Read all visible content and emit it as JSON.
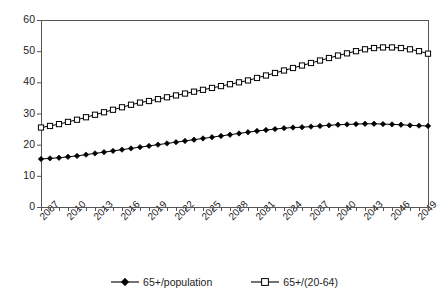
{
  "chart_data": {
    "type": "line",
    "title": "",
    "subtitle": "",
    "xlabel": "",
    "ylabel": "",
    "ylim": [
      0,
      60
    ],
    "ytick_values": [
      0,
      10,
      20,
      30,
      40,
      50,
      60
    ],
    "ytick_labels": [
      "0",
      "10",
      "20",
      "30",
      "40",
      "50",
      "60"
    ],
    "grid": false,
    "legend_position": "bottom",
    "x": [
      2007,
      2008,
      2009,
      2010,
      2011,
      2012,
      2013,
      2014,
      2015,
      2016,
      2017,
      2018,
      2019,
      2020,
      2021,
      2022,
      2023,
      2024,
      2025,
      2026,
      2027,
      2028,
      2029,
      2030,
      2031,
      2032,
      2033,
      2034,
      2035,
      2036,
      2037,
      2038,
      2039,
      2040,
      2041,
      2042,
      2043,
      2044,
      2045,
      2046,
      2047,
      2048,
      2049,
      2050
    ],
    "xlim": [
      2007,
      2050
    ],
    "xtick_labels": [
      "2007",
      "2010",
      "2013",
      "2016",
      "2019",
      "2022",
      "2025",
      "2028",
      "2031",
      "2034",
      "2037",
      "2040",
      "2043",
      "2046",
      "2049"
    ],
    "xtick_values": [
      2007,
      2010,
      2013,
      2016,
      2019,
      2022,
      2025,
      2028,
      2031,
      2034,
      2037,
      2040,
      2043,
      2046,
      2049
    ],
    "series": [
      {
        "name": "65+/population",
        "marker": "filled-diamond",
        "color": "#000000",
        "values": [
          15.4,
          15.6,
          15.8,
          16.1,
          16.4,
          16.8,
          17.2,
          17.6,
          18.0,
          18.4,
          18.8,
          19.2,
          19.6,
          20.0,
          20.4,
          20.8,
          21.2,
          21.6,
          22.0,
          22.4,
          22.8,
          23.2,
          23.6,
          24.0,
          24.4,
          24.7,
          25.0,
          25.3,
          25.5,
          25.6,
          25.8,
          26.0,
          26.2,
          26.4,
          26.5,
          26.6,
          26.7,
          26.7,
          26.6,
          26.5,
          26.4,
          26.2,
          26.1,
          26.0
        ]
      },
      {
        "name": "65+/(20-64)",
        "marker": "open-square",
        "color": "#000000",
        "values": [
          25.5,
          26.0,
          26.6,
          27.3,
          28.0,
          28.8,
          29.6,
          30.4,
          31.2,
          32.0,
          32.8,
          33.5,
          34.0,
          34.6,
          35.2,
          35.8,
          36.4,
          37.0,
          37.6,
          38.2,
          38.8,
          39.4,
          40.0,
          40.6,
          41.4,
          42.2,
          43.0,
          43.8,
          44.6,
          45.4,
          46.2,
          47.0,
          47.8,
          48.6,
          49.3,
          50.0,
          50.6,
          51.0,
          51.2,
          51.2,
          51.0,
          50.6,
          50.0,
          49.2
        ]
      }
    ],
    "legend": [
      "65+/population",
      "65+/(20-64)"
    ],
    "plot_area": {
      "left": 41,
      "right": 428,
      "top": 20,
      "bottom": 207
    },
    "axis_color": "#555555",
    "line_color": "#000000"
  }
}
